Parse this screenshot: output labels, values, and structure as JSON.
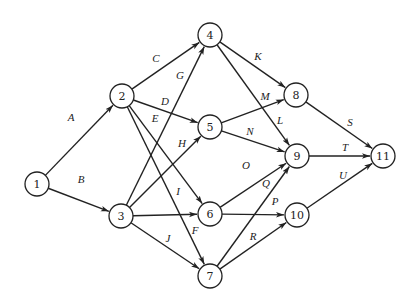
{
  "diagram": {
    "type": "activity-network",
    "nodes": [
      {
        "id": "1",
        "label": "1"
      },
      {
        "id": "2",
        "label": "2"
      },
      {
        "id": "3",
        "label": "3"
      },
      {
        "id": "4",
        "label": "4"
      },
      {
        "id": "5",
        "label": "5"
      },
      {
        "id": "6",
        "label": "6"
      },
      {
        "id": "7",
        "label": "7"
      },
      {
        "id": "8",
        "label": "8"
      },
      {
        "id": "9",
        "label": "9"
      },
      {
        "id": "10",
        "label": "10"
      },
      {
        "id": "11",
        "label": "11"
      }
    ],
    "edges": [
      {
        "label": "A",
        "from": "1",
        "to": "2"
      },
      {
        "label": "B",
        "from": "1",
        "to": "3"
      },
      {
        "label": "C",
        "from": "2",
        "to": "4"
      },
      {
        "label": "D",
        "from": "2",
        "to": "5"
      },
      {
        "label": "E",
        "from": "2",
        "to": "6"
      },
      {
        "label": "F",
        "from": "2",
        "to": "7"
      },
      {
        "label": "G",
        "from": "3",
        "to": "4"
      },
      {
        "label": "H",
        "from": "3",
        "to": "5"
      },
      {
        "label": "I",
        "from": "3",
        "to": "6"
      },
      {
        "label": "J",
        "from": "3",
        "to": "7"
      },
      {
        "label": "K",
        "from": "4",
        "to": "8"
      },
      {
        "label": "L",
        "from": "4",
        "to": "9"
      },
      {
        "label": "M",
        "from": "5",
        "to": "8"
      },
      {
        "label": "N",
        "from": "5",
        "to": "9"
      },
      {
        "label": "O",
        "from": "6",
        "to": "9"
      },
      {
        "label": "P",
        "from": "6",
        "to": "10"
      },
      {
        "label": "Q",
        "from": "7",
        "to": "9"
      },
      {
        "label": "R",
        "from": "7",
        "to": "10"
      },
      {
        "label": "S",
        "from": "8",
        "to": "11"
      },
      {
        "label": "T",
        "from": "9",
        "to": "11"
      },
      {
        "label": "U",
        "from": "10",
        "to": "11"
      }
    ]
  }
}
